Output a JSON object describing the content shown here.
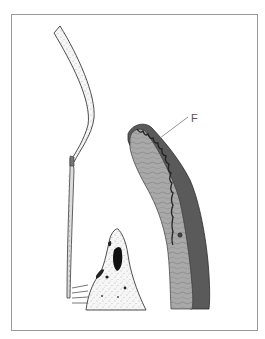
{
  "figure": {
    "type": "anatomical-illustration",
    "labels": [
      {
        "id": "F",
        "text": "F"
      }
    ],
    "colors": {
      "frame": "#9a9a9a",
      "outline": "#3a3a3a",
      "stipple_fill": "#f4f4f4",
      "dark_band": "#5a5a5a",
      "mid_band": "#a8a8a8",
      "black_spot": "#111111",
      "leader_line": "#777777"
    }
  }
}
